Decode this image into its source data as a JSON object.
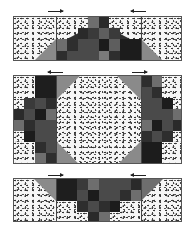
{
  "diagram": {
    "type": "quilt-block-assembly",
    "colors": {
      "print": "#f6f6f6",
      "medium_gray": "#8a8a8a",
      "dark_gray": "#4a4a4a",
      "charcoal": "#2e2e2e",
      "black": "#1c1c1c",
      "mid_dark": "#5e5e5e",
      "border": "#555555"
    },
    "top_row": {
      "arrows": [
        {
          "direction": "right",
          "x": 48,
          "y": 9
        },
        {
          "direction": "left",
          "x": 131,
          "y": 9
        }
      ]
    },
    "middle_row": {
      "arrows": [
        {
          "direction": "left",
          "x": 48,
          "y": 70
        },
        {
          "direction": "right",
          "x": 132,
          "y": 70
        }
      ]
    },
    "bottom_row": {
      "arrows": [
        {
          "direction": "right",
          "x": 48,
          "y": 173
        },
        {
          "direction": "left",
          "x": 131,
          "y": 173
        }
      ]
    }
  }
}
